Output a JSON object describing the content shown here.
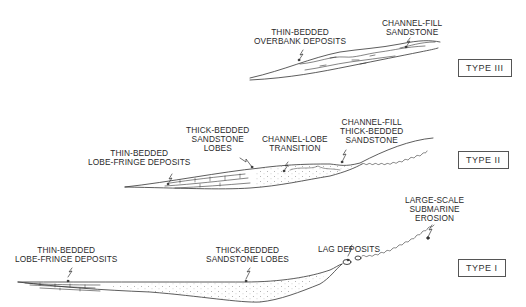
{
  "figure": {
    "panels": [
      {
        "type_label": "TYPE III",
        "labels": [
          {
            "id": "overbank",
            "lines": [
              "THIN-BEDDED",
              "OVERBANK DEPOSITS"
            ]
          },
          {
            "id": "channel_fill",
            "lines": [
              "CHANNEL-FILL",
              "SANDSTONE"
            ]
          }
        ]
      },
      {
        "type_label": "TYPE II",
        "labels": [
          {
            "id": "lobe_fringe",
            "lines": [
              "THIN-BEDDED",
              "LOBE-FRINGE DEPOSITS"
            ]
          },
          {
            "id": "lobes",
            "lines": [
              "THICK-BEDDED",
              "SANDSTONE",
              "LOBES"
            ]
          },
          {
            "id": "transition",
            "lines": [
              "CHANNEL-LOBE",
              "TRANSITION"
            ]
          },
          {
            "id": "channel_fill",
            "lines": [
              "CHANNEL-FILL",
              "THICK-BEDDED",
              "SANDSTONE"
            ]
          }
        ]
      },
      {
        "type_label": "TYPE I",
        "labels": [
          {
            "id": "lobe_fringe",
            "lines": [
              "THIN-BEDDED",
              "LOBE-FRINGE DEPOSITS"
            ]
          },
          {
            "id": "lobes",
            "lines": [
              "THICK-BEDDED",
              "SANDSTONE LOBES"
            ]
          },
          {
            "id": "lag",
            "lines": [
              "LAG DEPOSITS"
            ]
          },
          {
            "id": "erosion",
            "lines": [
              "LARGE-SCALE",
              "SUBMARINE",
              "EROSION"
            ]
          }
        ]
      }
    ]
  }
}
